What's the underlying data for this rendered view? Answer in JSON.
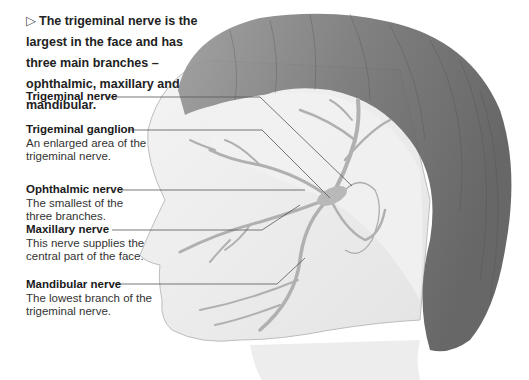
{
  "intro": {
    "marker": "▷",
    "text": "The trigeminal nerve is the largest in the face and has three main branches – ophthalmic, maxillary and mandibular."
  },
  "labels": [
    {
      "id": "trigeminal-nerve",
      "title": "Trigeminal nerve",
      "description": ""
    },
    {
      "id": "trigeminal-ganglion",
      "title": "Trigeminal ganglion",
      "description": "An enlarged area of the trigeminal nerve."
    },
    {
      "id": "ophthalmic-nerve",
      "title": "Ophthalmic nerve",
      "description": "The smallest of the three branches."
    },
    {
      "id": "maxillary-nerve",
      "title": "Maxillary nerve",
      "description": "This nerve supplies the central part of the face."
    },
    {
      "id": "mandibular-nerve",
      "title": "Mandibular nerve",
      "description": "The lowest branch of the trigeminal nerve."
    }
  ],
  "colors": {
    "hair": "#6e6e6e",
    "skin": "#efefef",
    "nerve": "#b4b4b4",
    "leader_line": "#555555",
    "text": "#1e1e1e"
  }
}
